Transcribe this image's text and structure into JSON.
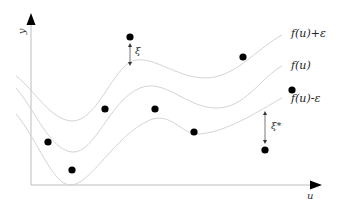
{
  "diagram": {
    "axes": {
      "x_label": "u",
      "y_label": "y"
    },
    "curves": [
      {
        "name": "upper-bound",
        "label": "f(u)+ε",
        "color": "#d0d0d0"
      },
      {
        "name": "regression",
        "label": "f(u)",
        "color": "#d0d0d0"
      },
      {
        "name": "lower-bound",
        "label": "f(u)-ε",
        "color": "#d0d0d0"
      }
    ],
    "slack_labels": {
      "above": "ξ",
      "below": "ξ*"
    },
    "points": [
      {
        "x": 130,
        "y": 37
      },
      {
        "x": 243,
        "y": 57
      },
      {
        "x": 292,
        "y": 90
      },
      {
        "x": 105,
        "y": 109
      },
      {
        "x": 155,
        "y": 109
      },
      {
        "x": 48,
        "y": 142
      },
      {
        "x": 194,
        "y": 132
      },
      {
        "x": 72,
        "y": 170
      },
      {
        "x": 265,
        "y": 150
      }
    ],
    "colors": {
      "axis": "#bdbdbd",
      "arrow": "#000000",
      "point": "#000000",
      "curve": "#d4d4d4"
    }
  }
}
